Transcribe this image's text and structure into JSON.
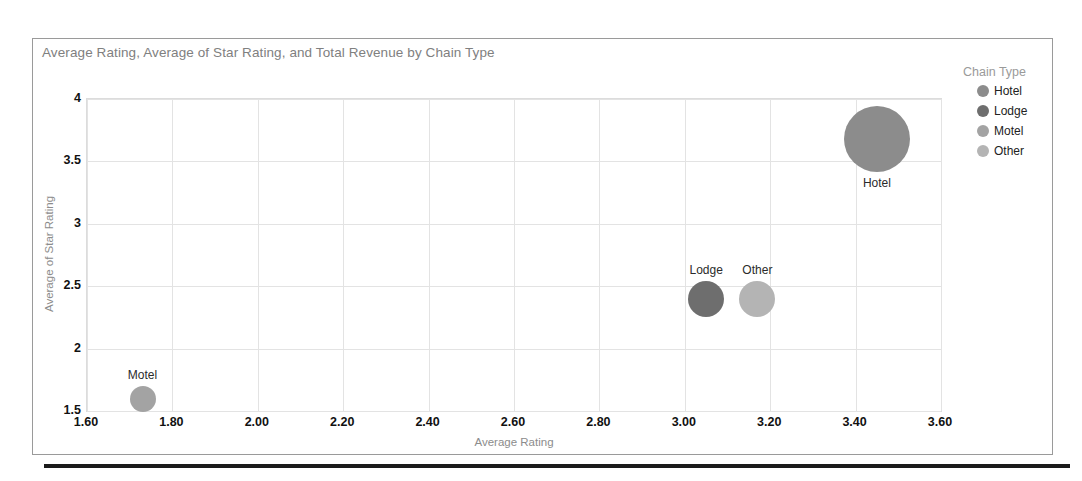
{
  "report": {
    "title": "Average Rating, Average of Star Rating, and Total Revenue by Chain Type"
  },
  "legend": {
    "title": "Chain Type",
    "items": [
      {
        "label": "Hotel",
        "color": "#8c8c8c"
      },
      {
        "label": "Lodge",
        "color": "#6e6e6e"
      },
      {
        "label": "Motel",
        "color": "#a3a3a3"
      },
      {
        "label": "Other",
        "color": "#b4b4b4"
      }
    ]
  },
  "chart_data": {
    "type": "scatter",
    "title": "Average Rating, Average of Star Rating, and Total Revenue by Chain Type",
    "xlabel": "Average Rating",
    "ylabel": "Average of Star Rating",
    "xlim": [
      1.6,
      3.6
    ],
    "ylim": [
      1.5,
      4.0
    ],
    "xticks": [
      "1.60",
      "1.80",
      "2.00",
      "2.20",
      "2.40",
      "2.60",
      "2.80",
      "3.00",
      "3.20",
      "3.40",
      "3.60"
    ],
    "xtick_values": [
      1.6,
      1.8,
      2.0,
      2.2,
      2.4,
      2.6,
      2.8,
      3.0,
      3.2,
      3.4,
      3.6
    ],
    "yticks": [
      "1.5",
      "2",
      "2.5",
      "3",
      "3.5",
      "4"
    ],
    "ytick_values": [
      1.5,
      2.0,
      2.5,
      3.0,
      3.5,
      4.0
    ],
    "grid": true,
    "legend_position": "right",
    "size_encodes": "Total Revenue",
    "points": [
      {
        "label": "Hotel",
        "x": 3.45,
        "y": 3.68,
        "radius_px": 33,
        "color": "#8c8c8c"
      },
      {
        "label": "Lodge",
        "x": 3.05,
        "y": 2.4,
        "radius_px": 18,
        "color": "#6e6e6e"
      },
      {
        "label": "Other",
        "x": 3.17,
        "y": 2.4,
        "radius_px": 18,
        "color": "#b4b4b4"
      },
      {
        "label": "Motel",
        "x": 1.73,
        "y": 1.6,
        "radius_px": 13,
        "color": "#a3a3a3"
      }
    ]
  }
}
